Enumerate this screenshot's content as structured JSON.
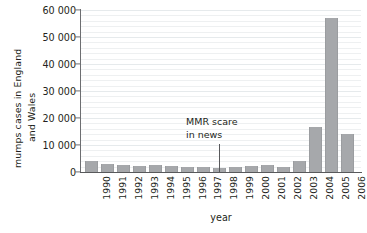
{
  "chart_data": {
    "type": "bar",
    "title": "",
    "xlabel": "year",
    "ylabel": "mumps cases in England and Wales",
    "ylabel_lines": [
      "mumps cases in England",
      "and Wales"
    ],
    "categories": [
      "1990",
      "1991",
      "1992",
      "1993",
      "1994",
      "1995",
      "1996",
      "1997",
      "1998",
      "1999",
      "2000",
      "2001",
      "2002",
      "2003",
      "2004",
      "2005",
      "2006"
    ],
    "values": [
      4200,
      3100,
      2600,
      2100,
      2700,
      2200,
      1900,
      1800,
      1500,
      1700,
      2100,
      2500,
      2000,
      4200,
      16800,
      57000,
      14000
    ],
    "ylim": [
      0,
      60000
    ],
    "yticks": [
      0,
      10000,
      20000,
      30000,
      40000,
      50000,
      60000
    ],
    "ytick_labels": [
      "0",
      "10 000",
      "20 000",
      "30 000",
      "40 000",
      "50 000",
      "60 000"
    ],
    "grid": true,
    "legend": "none",
    "bar_color": "#a6a8ab",
    "axis_color": "#58595b",
    "annotations": [
      {
        "text_lines": [
          "MMR scare",
          "in news"
        ],
        "points_to_category": "1998"
      }
    ]
  },
  "axis_titles": {
    "x": "year",
    "y_line1": "mumps cases in England",
    "y_line2": "and Wales"
  },
  "annotation": {
    "line1": "MMR scare",
    "line2": "in news"
  }
}
